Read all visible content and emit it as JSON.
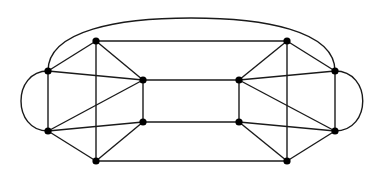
{
  "diagram": {
    "type": "graph",
    "colors": {
      "edge": "#1a1a1a",
      "node": "#000000",
      "background": "#ffffff"
    },
    "nodes": [
      {
        "id": "L1",
        "x": 48,
        "y": 71
      },
      {
        "id": "L2",
        "x": 48,
        "y": 131
      },
      {
        "id": "A",
        "x": 96,
        "y": 41
      },
      {
        "id": "B",
        "x": 96,
        "y": 161
      },
      {
        "id": "C",
        "x": 143,
        "y": 80
      },
      {
        "id": "D",
        "x": 143,
        "y": 122
      },
      {
        "id": "G",
        "x": 239,
        "y": 80
      },
      {
        "id": "H",
        "x": 239,
        "y": 122
      },
      {
        "id": "E",
        "x": 287,
        "y": 41
      },
      {
        "id": "F",
        "x": 287,
        "y": 161
      },
      {
        "id": "R1",
        "x": 335,
        "y": 71
      },
      {
        "id": "R2",
        "x": 335,
        "y": 131
      }
    ],
    "edges": [
      [
        "L1",
        "A"
      ],
      [
        "L1",
        "L2"
      ],
      [
        "L1",
        "C"
      ],
      [
        "L2",
        "C"
      ],
      [
        "L2",
        "D"
      ],
      [
        "L2",
        "B"
      ],
      [
        "A",
        "B"
      ],
      [
        "A",
        "C"
      ],
      [
        "B",
        "D"
      ],
      [
        "C",
        "D"
      ],
      [
        "R1",
        "E"
      ],
      [
        "R1",
        "R2"
      ],
      [
        "R1",
        "G"
      ],
      [
        "R2",
        "G"
      ],
      [
        "R2",
        "H"
      ],
      [
        "R2",
        "F"
      ],
      [
        "E",
        "F"
      ],
      [
        "E",
        "G"
      ],
      [
        "F",
        "H"
      ],
      [
        "G",
        "H"
      ],
      [
        "A",
        "E"
      ],
      [
        "C",
        "G"
      ],
      [
        "D",
        "H"
      ],
      [
        "B",
        "F"
      ]
    ],
    "curved_edges": [
      {
        "from": "L1",
        "to": "L2",
        "path": "M48,71 C12,71 12,131 48,131"
      },
      {
        "from": "R1",
        "to": "R2",
        "path": "M335,71 C372,71 372,131 335,131"
      },
      {
        "from": "L1",
        "to": "R1",
        "path": "M48,71 C48,30 120,18 191,18 C262,18 335,30 335,71"
      }
    ]
  }
}
